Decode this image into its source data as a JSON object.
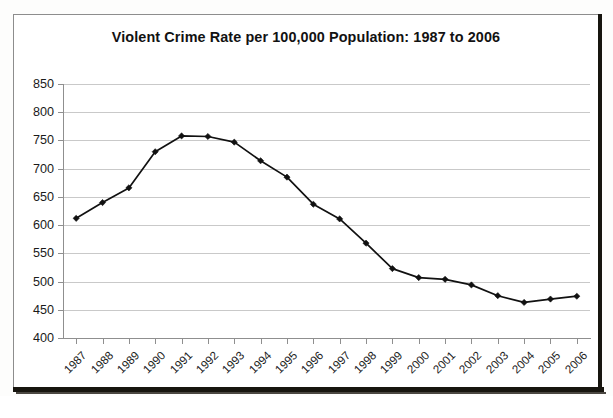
{
  "chart_data": {
    "type": "line",
    "title": "Violent Crime Rate per 100,000 Population: 1987 to 2006",
    "xlabel": "",
    "ylabel": "",
    "categories": [
      "1987",
      "1988",
      "1989",
      "1990",
      "1991",
      "1992",
      "1993",
      "1994",
      "1995",
      "1996",
      "1997",
      "1998",
      "1999",
      "2000",
      "2001",
      "2002",
      "2003",
      "2004",
      "2005",
      "2006"
    ],
    "values": [
      612,
      640,
      666,
      730,
      758,
      757,
      747,
      714,
      685,
      637,
      611,
      568,
      523,
      507,
      504,
      494,
      475,
      463,
      469,
      474
    ],
    "series": [
      {
        "name": "Violent Crime Rate",
        "values": [
          612,
          640,
          666,
          730,
          758,
          757,
          747,
          714,
          685,
          637,
          611,
          568,
          523,
          507,
          504,
          494,
          475,
          463,
          469,
          474
        ]
      }
    ],
    "ylim": [
      400,
      850
    ],
    "ytick_step": 50,
    "yticks": [
      "850",
      "800",
      "750",
      "700",
      "650",
      "600",
      "550",
      "500",
      "450",
      "400"
    ],
    "xtick_rotation": -45,
    "grid": true,
    "grid_axis": "y",
    "legend": false,
    "legend_position": "none",
    "marker": "diamond",
    "line_color": "#111111",
    "marker_color": "#111111",
    "grid_color": "#c9c9c9",
    "plot_background": "#ffffff"
  },
  "figure": {
    "border_color": "#8d8d8d",
    "page_background": "#fdfdfc",
    "scan_edge_color": "#17150f"
  }
}
